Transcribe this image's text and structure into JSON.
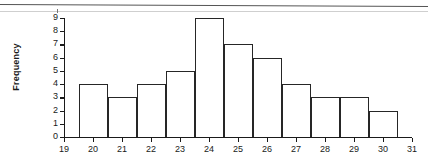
{
  "chart_data": {
    "type": "bar",
    "title": "",
    "subtitle": "",
    "xlabel": "",
    "ylabel": "Frequency",
    "grid": false,
    "legend": false,
    "legend_position": "none",
    "bar_style": "histogram-adjacent-unfilled",
    "bin_width": 1,
    "categories": [
      "20",
      "21",
      "22",
      "23",
      "24",
      "25",
      "26",
      "27",
      "28",
      "29",
      "30"
    ],
    "values": [
      4,
      3,
      4,
      5,
      9,
      7,
      6,
      4,
      3,
      3,
      2
    ],
    "bin_edges": [
      19.5,
      20.5,
      21.5,
      22.5,
      23.5,
      24.5,
      25.5,
      26.5,
      27.5,
      28.5,
      29.5,
      30.5
    ],
    "xlim": [
      19,
      31
    ],
    "ylim": [
      0,
      9
    ],
    "x_ticks": [
      "19",
      "20",
      "21",
      "22",
      "23",
      "24",
      "25",
      "26",
      "27",
      "28",
      "29",
      "30",
      "31"
    ],
    "y_ticks": [
      "0",
      "1",
      "2",
      "3",
      "4",
      "5",
      "6",
      "7",
      "8",
      "9"
    ],
    "colors": {
      "bar_outline": "#262626",
      "bar_fill": "#ffffff",
      "axis": "#1a1a1a",
      "background": "#ffffff"
    }
  }
}
